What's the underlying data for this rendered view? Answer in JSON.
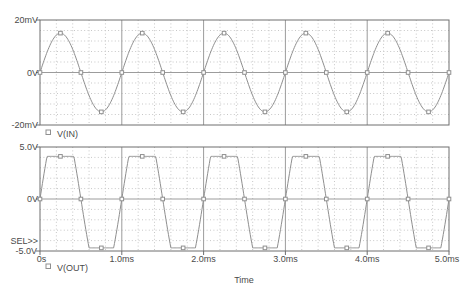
{
  "colors": {
    "background": "#ffffff",
    "trace": "#8f8f8f",
    "grid_minor": "#c7c7c7",
    "grid_major": "#9c9c9c",
    "axis_border": "#6e6e6e",
    "text": "#4a4a4a",
    "marker_fill": "#ffffff"
  },
  "sel_indicator": "SEL>>",
  "time_axis": {
    "label": "Time",
    "tick_labels": [
      "0s",
      "1.0ms",
      "2.0ms",
      "3.0ms",
      "4.0ms",
      "5.0ms"
    ],
    "tick_values_ms": [
      0,
      1,
      2,
      3,
      4,
      5
    ],
    "range_ms": [
      0,
      5
    ]
  },
  "chart_data": [
    {
      "type": "line",
      "name": "V(IN)",
      "legend_label": "V(IN)",
      "legend_symbol": "square-marker",
      "x_range_ms": [
        0,
        5
      ],
      "x_minor_step_ms": 0.2,
      "x_major_step_ms": 1.0,
      "y_unit": "mV",
      "y_range": [
        -20,
        20
      ],
      "y_minor_step": 4,
      "y_ticks": [
        {
          "value": 20,
          "label": "20mV"
        },
        {
          "value": 0,
          "label": "0V"
        },
        {
          "value": -20,
          "label": "-20mV"
        }
      ],
      "signal": {
        "shape": "sine",
        "frequency_cycles_per_ms": 1,
        "period_ms": 1.0,
        "amplitude": 15,
        "offset": 0,
        "zero_crossings_ms": [
          0,
          0.5,
          1,
          1.5,
          2,
          2.5,
          3,
          3.5,
          4,
          4.5,
          5
        ],
        "peak_times_ms": [
          0.25,
          1.25,
          2.25,
          3.25,
          4.25
        ],
        "trough_times_ms": [
          0.75,
          1.75,
          2.75,
          3.75,
          4.75
        ]
      },
      "marker_spacing_ms": 0.25
    },
    {
      "type": "line",
      "name": "V(OUT)",
      "legend_label": "V(OUT)",
      "legend_symbol": "square-marker",
      "x_range_ms": [
        0,
        5
      ],
      "x_minor_step_ms": 0.2,
      "x_major_step_ms": 1.0,
      "y_unit": "V",
      "y_range": [
        -5,
        5
      ],
      "y_minor_step": 1,
      "y_ticks": [
        {
          "value": 5,
          "label": "5.0V"
        },
        {
          "value": 0,
          "label": "0V"
        },
        {
          "value": -5,
          "label": "-5.0V"
        }
      ],
      "signal": {
        "shape": "clipped_sine",
        "frequency_cycles_per_ms": 1,
        "period_ms": 1.0,
        "drive_amplitude": 8,
        "clip_high": 4.1,
        "clip_low": -4.7,
        "flat_top_interval_ms": [
          0.09,
          0.41
        ],
        "flat_bottom_interval_ms": [
          0.6,
          0.9
        ],
        "zero_crossings_ms": [
          0,
          0.5,
          1,
          1.5,
          2,
          2.5,
          3,
          3.5,
          4,
          4.5,
          5
        ]
      },
      "marker_spacing_ms": 0.25
    }
  ]
}
